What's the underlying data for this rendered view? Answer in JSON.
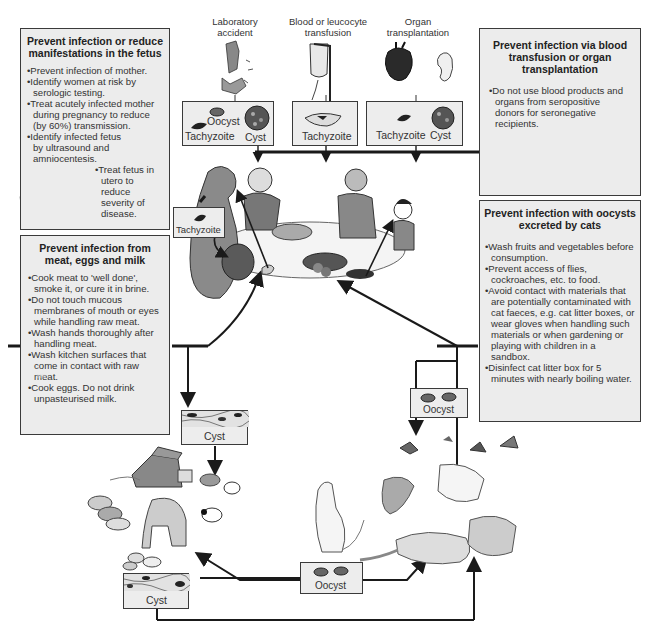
{
  "sources": [
    {
      "label": "Laboratory\naccident",
      "line1": "Laboratory",
      "line2": "accident"
    },
    {
      "label": "Blood or leucocyte transfusion",
      "line1": "Blood or leucocyte",
      "line2": "transfusion"
    },
    {
      "label": "Organ transplantation",
      "line1": "Organ",
      "line2": "transplantation"
    }
  ],
  "stage_boxes": {
    "lab": {
      "tachyzoite": "Tachyzoite",
      "oocyst": "Oocyst",
      "cyst": "Cyst"
    },
    "blood": {
      "tachyzoite": "Tachyzoite"
    },
    "organ": {
      "tachyzoite": "Tachyzoite",
      "cyst": "Cyst"
    },
    "fetus": {
      "tachyzoite": "Tachyzoite"
    },
    "meat_cyst": {
      "cyst": "Cyst"
    },
    "rodent_cyst": {
      "cyst": "Cyst"
    },
    "cat_oocyst_upper": {
      "oocyst": "Oocyst"
    },
    "cat_oocyst_lower": {
      "oocyst": "Oocyst"
    }
  },
  "panels": {
    "fetus": {
      "title_line1": "Prevent infection or reduce",
      "title_line2": "manifestations in the fetus",
      "items": [
        "Prevent infection of mother.",
        "Identify women at risk by serologic testing.",
        "Treat acutely infected mother during pregnancy to reduce (by 60%) transmission.",
        "Identify infected fetus by ultrasound and amniocentesis."
      ],
      "sub_item": "Treat fetus in utero to reduce severity of disease."
    },
    "transfusion": {
      "title_line1": "Prevent infection via blood",
      "title_line2": "transfusion or organ",
      "title_line3": "transplantation",
      "items": [
        "Do not use blood products and organs from seropositive donors for seronegative recipients."
      ]
    },
    "meat": {
      "title_line1": "Prevent infection from",
      "title_line2": "meat, eggs and milk",
      "items": [
        "Cook meat to 'well done', smoke it, or cure it in brine.",
        "Do not touch mucous membranes of mouth or eyes while handling raw meat.",
        "Wash hands thoroughly after handling meat.",
        "Wash kitchen surfaces that come in contact with raw meat.",
        "Cook eggs. Do not drink unpasteurised milk."
      ],
      "milk_label": "Milk"
    },
    "cats": {
      "title_line1": "Prevent infection with oocysts",
      "title_line2": "excreted by cats",
      "items": [
        "Wash fruits and vegetables before consumption.",
        "Prevent access of flies, cockroaches, etc. to food.",
        "Avoid contact with materials that are potentially contaminated with cat faeces, e.g. cat litter boxes, or wear gloves when handling such materials or when gardening or playing with children in a sandbox.",
        "Disinfect cat litter box for 5 minutes with nearly boiling water."
      ]
    }
  },
  "colors": {
    "panel_fill": "#ececec",
    "border": "#3a3a3a",
    "arrow": "#1a1a1a",
    "illustration_gray": "#9a9a9a"
  }
}
